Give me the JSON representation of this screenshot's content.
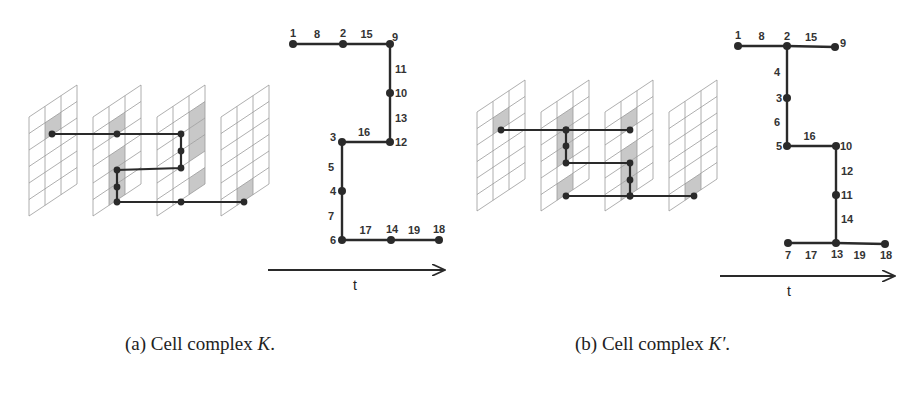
{
  "figure": {
    "panels": [
      {
        "id": "a",
        "caption_prefix": "(a) Cell complex ",
        "caption_symbol": "K",
        "caption_suffix": ".",
        "graph": {
          "nodes": [
            {
              "label": "1",
              "x": 293,
              "y": 44
            },
            {
              "label": "2",
              "x": 343,
              "y": 44
            },
            {
              "label": "9",
              "x": 390,
              "y": 44
            },
            {
              "label": "10",
              "x": 390,
              "y": 93
            },
            {
              "label": "12",
              "x": 390,
              "y": 142
            },
            {
              "label": "3",
              "x": 342,
              "y": 142
            },
            {
              "label": "4",
              "x": 342,
              "y": 191
            },
            {
              "label": "6",
              "x": 342,
              "y": 240
            },
            {
              "label": "14",
              "x": 391,
              "y": 240
            },
            {
              "label": "18",
              "x": 439,
              "y": 240
            }
          ],
          "edges": [
            {
              "label": "8",
              "from": "1",
              "to": "2"
            },
            {
              "label": "15",
              "from": "2",
              "to": "9"
            },
            {
              "label": "11",
              "from": "9",
              "to": "10"
            },
            {
              "label": "13",
              "from": "10",
              "to": "12"
            },
            {
              "label": "16",
              "from": "3",
              "to": "12"
            },
            {
              "label": "5",
              "from": "3",
              "to": "4"
            },
            {
              "label": "7",
              "from": "4",
              "to": "6"
            },
            {
              "label": "17",
              "from": "6",
              "to": "14"
            },
            {
              "label": "19",
              "from": "14",
              "to": "18"
            }
          ]
        },
        "axis_label": "t"
      },
      {
        "id": "b",
        "caption_prefix": "(b) Cell complex ",
        "caption_symbol": "K′",
        "caption_suffix": ".",
        "graph": {
          "nodes": [
            {
              "label": "1",
              "x": 738,
              "y": 46
            },
            {
              "label": "2",
              "x": 787,
              "y": 46
            },
            {
              "label": "9",
              "x": 835,
              "y": 47
            },
            {
              "label": "3",
              "x": 787,
              "y": 98
            },
            {
              "label": "5",
              "x": 787,
              "y": 146
            },
            {
              "label": "10",
              "x": 836,
              "y": 146
            },
            {
              "label": "11",
              "x": 836,
              "y": 195
            },
            {
              "label": "13",
              "x": 836,
              "y": 243
            },
            {
              "label": "7",
              "x": 788,
              "y": 243
            },
            {
              "label": "18",
              "x": 885,
              "y": 244
            }
          ],
          "edges": [
            {
              "label": "8",
              "from": "1",
              "to": "2"
            },
            {
              "label": "15",
              "from": "2",
              "to": "9"
            },
            {
              "label": "4",
              "from": "2",
              "to": "3"
            },
            {
              "label": "6",
              "from": "3",
              "to": "5"
            },
            {
              "label": "16",
              "from": "5",
              "to": "10"
            },
            {
              "label": "12",
              "from": "10",
              "to": "11"
            },
            {
              "label": "14",
              "from": "11",
              "to": "13"
            },
            {
              "label": "17",
              "from": "7",
              "to": "13"
            },
            {
              "label": "19",
              "from": "13",
              "to": "18"
            }
          ]
        },
        "axis_label": "t"
      }
    ]
  },
  "colors": {
    "line": "#2a2a2a",
    "grid": "#9a9a9a",
    "highlight": "#c8c8c8",
    "text": "#333333"
  }
}
